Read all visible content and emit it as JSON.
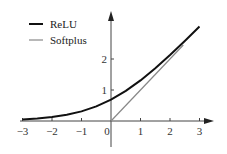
{
  "chart_data": {
    "type": "line",
    "title": "",
    "xlabel": "",
    "ylabel": "",
    "xlim": [
      -3,
      3
    ],
    "ylim": [
      0,
      3
    ],
    "grid": false,
    "legend_position": "upper-left",
    "x_ticks": [
      "-3",
      "-2",
      "-1",
      "0",
      "1",
      "2",
      "3"
    ],
    "y_ticks": [
      "1",
      "2"
    ],
    "series": [
      {
        "name": "ReLU",
        "color": "#111111",
        "style": "thick",
        "function": "ln(1+e^x)",
        "x": [
          -3,
          -2.5,
          -2,
          -1.5,
          -1,
          -0.5,
          0,
          0.5,
          1,
          1.5,
          2,
          2.5,
          3
        ],
        "y": [
          0.05,
          0.08,
          0.13,
          0.2,
          0.31,
          0.47,
          0.69,
          0.97,
          1.31,
          1.7,
          2.13,
          2.58,
          3.05
        ]
      },
      {
        "name": "Softplus",
        "color": "#888888",
        "style": "thin",
        "function": "max(0,x)",
        "x": [
          0,
          2.45
        ],
        "y": [
          0,
          2.45
        ]
      }
    ]
  },
  "legend": {
    "items": [
      {
        "label": "ReLU",
        "color": "#111111"
      },
      {
        "label": "Softplus",
        "color": "#888888"
      }
    ]
  }
}
